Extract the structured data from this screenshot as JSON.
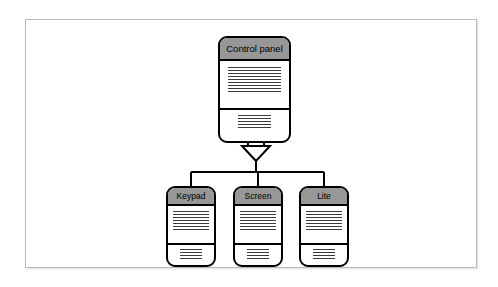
{
  "diagram": {
    "type": "uml-generalization-hierarchy",
    "title_text": "",
    "frame": {
      "label": "diagram-frame"
    },
    "relationship": {
      "kind": "generalization",
      "arrowhead": "hollow-triangle",
      "direction": "children-to-parent",
      "notation": "UML"
    },
    "parent": {
      "name": "Control panel",
      "compartments": [
        {
          "id": "attributes",
          "line_count": 9
        },
        {
          "id": "operations",
          "line_count": 5
        }
      ]
    },
    "children": [
      {
        "name": "Keypad",
        "compartments": [
          {
            "id": "attributes",
            "line_count": 7
          },
          {
            "id": "operations",
            "line_count": 4
          }
        ]
      },
      {
        "name": "Screen",
        "compartments": [
          {
            "id": "attributes",
            "line_count": 7
          },
          {
            "id": "operations",
            "line_count": 4
          }
        ]
      },
      {
        "name": "Lite",
        "compartments": [
          {
            "id": "attributes",
            "line_count": 7
          },
          {
            "id": "operations",
            "line_count": 4
          }
        ]
      }
    ],
    "colors": {
      "title_bar": "#979797",
      "node_border": "#000000",
      "node_fill": "#ffffff",
      "connector": "#000000",
      "frame_border": "#b9b9b9",
      "text_line": "#3b3b3b",
      "background": "#ffffff"
    }
  }
}
